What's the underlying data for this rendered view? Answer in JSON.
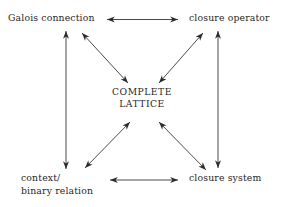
{
  "diagram": {
    "background_color": "#ffffff",
    "text_color": "#262626",
    "arrow_color": "#2b2b2b",
    "nodes": [
      {
        "id": "galois-connection",
        "label": "Galois connection",
        "lines": [
          "Galois connection"
        ],
        "position": "top-left"
      },
      {
        "id": "closure-operator",
        "label": "closure operator",
        "lines": [
          "closure operator"
        ],
        "position": "top-right"
      },
      {
        "id": "complete-lattice",
        "label": "COMPLETE LATTICE",
        "lines": [
          "COMPLETE",
          "LATTICE"
        ],
        "position": "center"
      },
      {
        "id": "context-binary-relation",
        "label": "context/ binary relation",
        "lines": [
          "context/",
          "binary relation"
        ],
        "position": "bottom-left"
      },
      {
        "id": "closure-system",
        "label": "closure system",
        "lines": [
          "closure system"
        ],
        "position": "bottom-right"
      }
    ],
    "edges": [
      {
        "id": "top-horizontal",
        "from": "galois-connection",
        "to": "closure-operator",
        "style": "double-headed"
      },
      {
        "id": "bottom-horizontal",
        "from": "context-binary-relation",
        "to": "closure-system",
        "style": "double-headed"
      },
      {
        "id": "left-vertical",
        "from": "galois-connection",
        "to": "context-binary-relation",
        "style": "double-headed"
      },
      {
        "id": "right-vertical",
        "from": "closure-operator",
        "to": "closure-system",
        "style": "double-headed"
      },
      {
        "id": "diagonal-top-left",
        "from": "galois-connection",
        "to": "complete-lattice",
        "style": "double-headed"
      },
      {
        "id": "diagonal-top-right",
        "from": "closure-operator",
        "to": "complete-lattice",
        "style": "double-headed"
      },
      {
        "id": "diagonal-bottom-left",
        "from": "context-binary-relation",
        "to": "complete-lattice",
        "style": "double-headed"
      },
      {
        "id": "diagonal-bottom-right",
        "from": "closure-system",
        "to": "complete-lattice",
        "style": "double-headed"
      }
    ]
  }
}
